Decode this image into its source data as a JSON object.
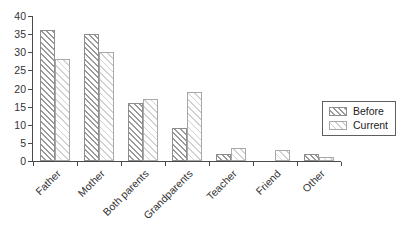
{
  "chart_data": {
    "type": "bar",
    "title": "",
    "xlabel": "",
    "ylabel": "",
    "categories": [
      "Father",
      "Mother",
      "Both parents",
      "Grandparents",
      "Teacher",
      "Friend",
      "Other"
    ],
    "series": [
      {
        "name": "Before",
        "pattern": "dense-diagonal-hatch",
        "values": [
          36,
          35,
          16,
          9,
          2,
          0,
          2
        ]
      },
      {
        "name": "Current",
        "pattern": "light-diagonal-hatch",
        "values": [
          28,
          30,
          17,
          19,
          3.5,
          3,
          1
        ]
      }
    ],
    "ylim": [
      0,
      40
    ],
    "yticks": [
      0,
      5,
      10,
      15,
      20,
      25,
      30,
      35,
      40
    ],
    "grid": false,
    "legend_position": "right",
    "x_label_rotation_deg": -45
  },
  "colors": {
    "background": "#ffffff",
    "axis": "#4a4a4a",
    "text": "#333333",
    "before_hatch": "#9a9a9a",
    "current_hatch": "#d2d2d2",
    "bar_fill": "#ffffff",
    "legend_border": "#5f5f5f"
  }
}
